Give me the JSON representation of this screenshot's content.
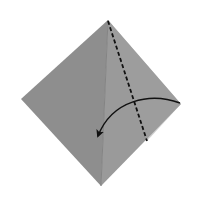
{
  "diagram": {
    "type": "origami-fold-step",
    "background": "#ffffff",
    "paper": {
      "vertices": {
        "top": [
          108,
          20
        ],
        "right": [
          181,
          104
        ],
        "bottom": [
          101,
          186
        ],
        "left": [
          21,
          99
        ]
      },
      "left_face_color": "#8e8e8e",
      "right_face_color": "#9a9a9a",
      "crease_color": "#7f7f7f"
    },
    "valley_fold_line": {
      "style": "dashed",
      "from": [
        108,
        20
      ],
      "to": [
        147,
        141
      ],
      "color": "#111111"
    },
    "fold_arrow": {
      "from": [
        181,
        104
      ],
      "to": [
        97,
        138
      ],
      "direction": "fold right flap to the left",
      "color": "#111111"
    }
  }
}
